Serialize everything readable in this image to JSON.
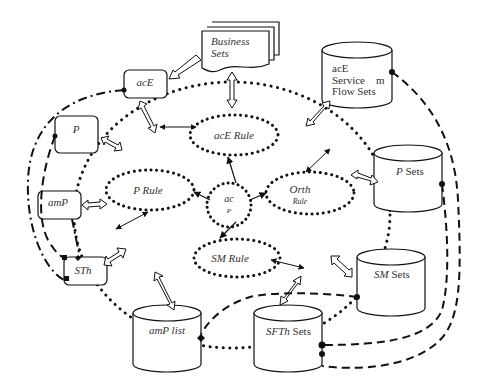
{
  "nodes": {
    "business_sets": "Business Sets",
    "business_sets_line1": "Business",
    "business_sets_line2": "Sets",
    "ace": "acE",
    "p": "P",
    "amp": "amP",
    "sth": "STh",
    "ace_service_flow_sets_line1": "acE",
    "ace_service_flow_sets_line2": "Service    m",
    "ace_service_flow_sets_line3": "Flow Sets",
    "p_sets_italic": "P",
    "p_sets_rest": " Sets",
    "sm_sets_italic": "SM",
    "sm_sets_rest": " Sets",
    "sfth_sets_italic": "SFTh",
    "sfth_sets_rest": " Sets",
    "amp_list": "amP list",
    "ace_rule": "acE Rule",
    "p_rule": "P Rule",
    "orth_rule_line1": "Orth",
    "orth_rule_line2": "Rule",
    "sm_rule": "SM Rule",
    "center_line1": "ac",
    "center_line2": "P"
  },
  "colors": {
    "stroke": "#111111",
    "text": "#333333",
    "background": "#ffffff"
  }
}
